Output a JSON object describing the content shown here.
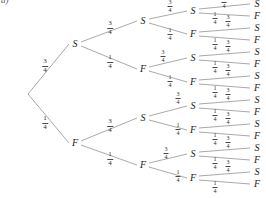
{
  "figure": {
    "label": "a)",
    "type": "probability-tree-diagram",
    "depth": 4,
    "branching": 2,
    "node_labels": [
      "S",
      "F"
    ],
    "branch_probabilities": {
      "upper": "3/4",
      "lower": "1/4"
    },
    "ink_color": "#8c8c8c",
    "text_color": "#1b1b1b"
  },
  "fractions": {
    "three_quarters": {
      "numerator": "3",
      "denominator": "4"
    },
    "one_quarter": {
      "numerator": "1",
      "denominator": "4"
    }
  },
  "chart_data": {
    "type": "tree",
    "title": "",
    "root": {
      "x": 22,
      "y": 94,
      "label": ""
    },
    "levels": [
      {
        "level": 1,
        "nodes": [
          {
            "id": "S",
            "label": "S",
            "x": 75,
            "y": 44,
            "prob": "3/4",
            "prob_x": 45,
            "prob_y": 66
          },
          {
            "id": "F",
            "label": "F",
            "x": 75,
            "y": 143,
            "prob": "1/4",
            "prob_x": 45,
            "prob_y": 123
          }
        ]
      },
      {
        "level": 2,
        "nodes": [
          {
            "id": "SS",
            "label": "S",
            "x": 143,
            "y": 21,
            "prob": "3/4",
            "prob_x": 110,
            "prob_y": 28
          },
          {
            "id": "SF",
            "label": "F",
            "x": 143,
            "y": 69,
            "prob": "1/4",
            "prob_x": 110,
            "prob_y": 62
          },
          {
            "id": "FS",
            "label": "S",
            "x": 143,
            "y": 118,
            "prob": "3/4",
            "prob_x": 110,
            "prob_y": 126
          },
          {
            "id": "FF",
            "label": "F",
            "x": 143,
            "y": 165,
            "prob": "1/4",
            "prob_x": 110,
            "prob_y": 159
          }
        ]
      },
      {
        "level": 3,
        "nodes": [
          {
            "id": "SSS",
            "label": "S",
            "x": 193,
            "y": 11,
            "prob": "3/4",
            "prob_x": 170,
            "prob_y": 6
          },
          {
            "id": "SSF",
            "label": "F",
            "x": 193,
            "y": 34,
            "prob": "1/4",
            "prob_x": 170,
            "prob_y": 34
          },
          {
            "id": "SFS",
            "label": "S",
            "x": 193,
            "y": 58,
            "prob": "3/4",
            "prob_x": 163,
            "prob_y": 56
          },
          {
            "id": "SFF",
            "label": "F",
            "x": 193,
            "y": 82,
            "prob": "1/4",
            "prob_x": 170,
            "prob_y": 81
          },
          {
            "id": "FSS",
            "label": "S",
            "x": 193,
            "y": 106,
            "prob": "3/4",
            "prob_x": 178,
            "prob_y": 98
          },
          {
            "id": "FSF",
            "label": "F",
            "x": 193,
            "y": 130,
            "prob": "1/4",
            "prob_x": 178,
            "prob_y": 129
          },
          {
            "id": "FFS",
            "label": "S",
            "x": 193,
            "y": 154,
            "prob": "3/4",
            "prob_x": 166,
            "prob_y": 153
          },
          {
            "id": "FFF",
            "label": "F",
            "x": 193,
            "y": 178,
            "prob": "1/4",
            "prob_x": 178,
            "prob_y": 176
          }
        ]
      },
      {
        "level": 4,
        "nodes": [
          {
            "id": "SSSS",
            "label": "S",
            "x": 257,
            "y": 4,
            "prob": "3/4",
            "prob_x": 224,
            "prob_y": 2
          },
          {
            "id": "SSSF",
            "label": "F",
            "x": 257,
            "y": 16,
            "prob": "1/4",
            "prob_x": 215,
            "prob_y": 18
          },
          {
            "id": "SSFS",
            "label": "S",
            "x": 257,
            "y": 28,
            "prob": "3/4",
            "prob_x": 228,
            "prob_y": 21
          },
          {
            "id": "SSFF",
            "label": "F",
            "x": 257,
            "y": 40,
            "prob": "1/4",
            "prob_x": 215,
            "prob_y": 44
          },
          {
            "id": "SFSS",
            "label": "S",
            "x": 257,
            "y": 52,
            "prob": "3/4",
            "prob_x": 228,
            "prob_y": 46
          },
          {
            "id": "SFSF",
            "label": "F",
            "x": 257,
            "y": 64,
            "prob": "1/4",
            "prob_x": 215,
            "prob_y": 67
          },
          {
            "id": "SFFS",
            "label": "S",
            "x": 257,
            "y": 76,
            "prob": "3/4",
            "prob_x": 228,
            "prob_y": 70
          },
          {
            "id": "SFFF",
            "label": "F",
            "x": 257,
            "y": 88,
            "prob": "1/4",
            "prob_x": 215,
            "prob_y": 92
          },
          {
            "id": "FSSS",
            "label": "S",
            "x": 257,
            "y": 100,
            "prob": "3/4",
            "prob_x": 228,
            "prob_y": 94
          },
          {
            "id": "FSSF",
            "label": "F",
            "x": 257,
            "y": 112,
            "prob": "1/4",
            "prob_x": 215,
            "prob_y": 115
          },
          {
            "id": "FSFS",
            "label": "S",
            "x": 257,
            "y": 124,
            "prob": "3/4",
            "prob_x": 228,
            "prob_y": 118
          },
          {
            "id": "FSFF",
            "label": "F",
            "x": 257,
            "y": 136,
            "prob": "1/4",
            "prob_x": 215,
            "prob_y": 139
          },
          {
            "id": "FFSS",
            "label": "S",
            "x": 257,
            "y": 148,
            "prob": "3/4",
            "prob_x": 228,
            "prob_y": 142
          },
          {
            "id": "FFSF",
            "label": "F",
            "x": 257,
            "y": 160,
            "prob": "1/4",
            "prob_x": 215,
            "prob_y": 163
          },
          {
            "id": "FFFS",
            "label": "S",
            "x": 257,
            "y": 172,
            "prob": "3/4",
            "prob_x": 228,
            "prob_y": 166
          },
          {
            "id": "FFFF",
            "label": "F",
            "x": 257,
            "y": 184,
            "prob": "1/4",
            "prob_x": 215,
            "prob_y": 187
          }
        ]
      }
    ]
  }
}
